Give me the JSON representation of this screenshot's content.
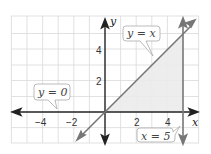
{
  "diagram": {
    "type": "coordinate-graph",
    "axes": {
      "x_label": "x",
      "y_label": "y"
    },
    "x_ticks": [
      {
        "value": -4,
        "label": "−4"
      },
      {
        "value": -2,
        "label": "−2"
      },
      {
        "value": 2,
        "label": "2"
      },
      {
        "value": 4,
        "label": "4"
      }
    ],
    "y_ticks": [
      {
        "value": 2,
        "label": "2"
      },
      {
        "value": 4,
        "label": "4"
      }
    ],
    "lines": [
      {
        "equation": "y = x",
        "label": "y = x"
      },
      {
        "equation": "y = 0",
        "label": "y = 0"
      },
      {
        "equation": "x = 5",
        "label": "x = 5"
      }
    ],
    "shaded_region": "triangle bounded by y = x, y = 0, x = 5",
    "colors": {
      "line": "#777777",
      "axis": "#222222",
      "grid": "#d9d9d9",
      "shade": "#eeeeee"
    }
  }
}
